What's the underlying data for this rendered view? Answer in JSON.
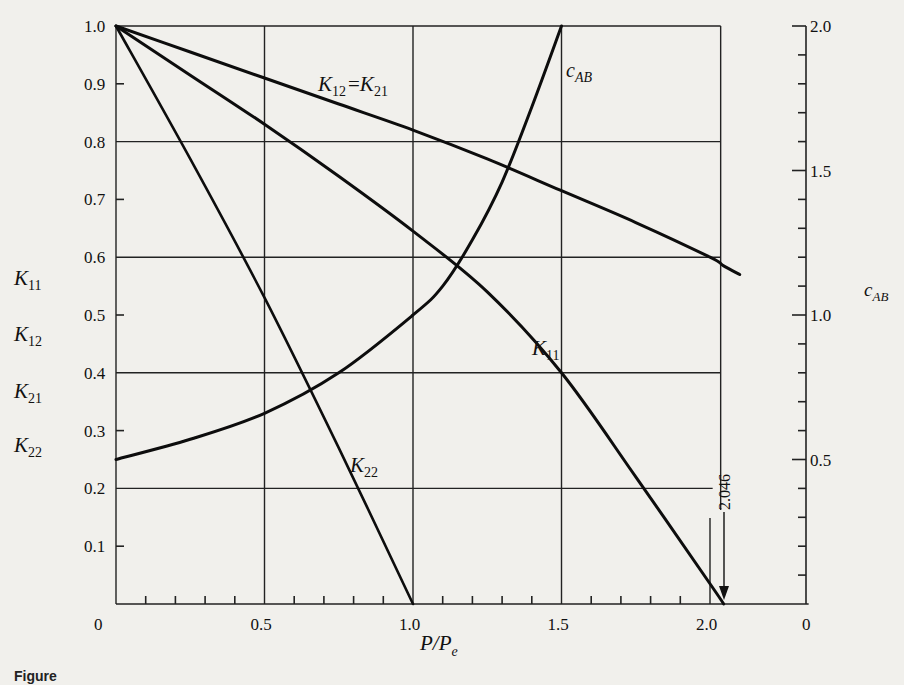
{
  "chart_data": {
    "type": "line",
    "title": "",
    "xlabel": "P/P_e",
    "ylabel_left": [
      "K11",
      "K12",
      "K21",
      "K22"
    ],
    "ylabel_right": "c_AB",
    "xlim": [
      0,
      2.046
    ],
    "ylim_left": [
      0,
      1.0
    ],
    "ylim_right": [
      0,
      2.0
    ],
    "grid": true,
    "x_ticks": [
      0,
      0.5,
      1.0,
      1.5,
      2.0
    ],
    "x_tick_labels": [
      "0",
      "0.5",
      "1.0",
      "1.5",
      "2.0"
    ],
    "y_ticks_left": [
      0.1,
      0.2,
      0.3,
      0.4,
      0.5,
      0.6,
      0.7,
      0.8,
      0.9,
      1.0
    ],
    "y_tick_labels_left": [
      "0.1",
      "0.2",
      "0.3",
      "0.4",
      "0.5",
      "0.6",
      "0.7",
      "0.8",
      "0.9",
      "1.0"
    ],
    "y_ticks_right": [
      0,
      0.5,
      1.0,
      1.5,
      2.0
    ],
    "y_tick_labels_right": [
      "0",
      "0.5",
      "1.0",
      "1.5",
      "2.0"
    ],
    "annotations": [
      {
        "text": "2.046",
        "x": 2.046,
        "note": "arrow marking K11 = 0 at P/Pe = 2.046"
      }
    ],
    "series": [
      {
        "name": "K12 = K21",
        "axis": "left",
        "x": [
          0,
          0.25,
          0.5,
          0.75,
          1.0,
          1.25,
          1.5,
          1.75,
          2.0,
          2.046,
          2.1
        ],
        "y": [
          1.0,
          0.955,
          0.91,
          0.865,
          0.82,
          0.77,
          0.715,
          0.66,
          0.6,
          0.585,
          0.57
        ]
      },
      {
        "name": "K11",
        "axis": "left",
        "x": [
          0,
          0.25,
          0.5,
          0.75,
          1.0,
          1.25,
          1.5,
          1.75,
          2.0,
          2.046
        ],
        "y": [
          1.0,
          0.915,
          0.83,
          0.74,
          0.645,
          0.54,
          0.4,
          0.22,
          0.035,
          0.0
        ]
      },
      {
        "name": "K22",
        "axis": "left",
        "x": [
          0,
          0.25,
          0.5,
          0.75,
          1.0
        ],
        "y": [
          1.0,
          0.77,
          0.53,
          0.27,
          0.0
        ]
      },
      {
        "name": "c_AB",
        "axis": "right",
        "x": [
          0,
          0.25,
          0.5,
          0.75,
          1.0,
          1.1,
          1.2,
          1.3,
          1.4,
          1.5
        ],
        "y": [
          0.5,
          0.57,
          0.66,
          0.8,
          1.0,
          1.1,
          1.26,
          1.46,
          1.72,
          2.0
        ]
      }
    ]
  },
  "labels": {
    "curve_k12_k21": "K₁₂ =K₂₁",
    "curve_k11": "K₁₁",
    "curve_k22": "K₂₂",
    "curve_cab": "c",
    "curve_cab_sub": "AB",
    "axis_left_k11": "K",
    "axis_left_k11_sub": "11",
    "axis_left_k12": "K",
    "axis_left_k12_sub": "12",
    "axis_left_k21": "K",
    "axis_left_k21_sub": "21",
    "axis_left_k22": "K",
    "axis_left_k22_sub": "22",
    "axis_right": "c",
    "axis_right_sub": "AB",
    "x_axis_main": "P/P",
    "x_axis_sub": "e",
    "annotation_2046": "2.046",
    "k12_main": "K",
    "k12_sub": "12",
    "k21_main": "K",
    "k21_sub": "21",
    "equals": "=",
    "k11_main": "K",
    "k11_sub": "11",
    "k22_main": "K",
    "k22_sub": "22",
    "caption": "Figure"
  }
}
